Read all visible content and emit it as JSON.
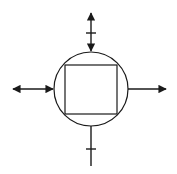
{
  "diagram": {
    "type": "control-block-diagram",
    "stroke_color": "#1a1a1a",
    "background_color": "#ffffff",
    "circle": {
      "cx": 91,
      "cy": 89,
      "r": 37
    },
    "square": {
      "x": 65,
      "y": 65,
      "width": 52,
      "height": 49
    },
    "connectors": [
      {
        "id": "top",
        "orientation": "vertical",
        "from": [
          91,
          12
        ],
        "to": [
          91,
          52
        ],
        "arrow_start": true,
        "arrow_end": true,
        "tick_at": 33
      },
      {
        "id": "left",
        "orientation": "horizontal",
        "from": [
          12,
          89
        ],
        "to": [
          53,
          89
        ],
        "arrow_start": true,
        "arrow_end": true,
        "tick_at": null
      },
      {
        "id": "right",
        "orientation": "horizontal",
        "from": [
          128,
          89
        ],
        "to": [
          167,
          89
        ],
        "arrow_start": false,
        "arrow_end": true,
        "tick_at": null
      },
      {
        "id": "bottom",
        "orientation": "vertical",
        "from": [
          91,
          126
        ],
        "to": [
          91,
          166
        ],
        "arrow_start": false,
        "arrow_end": false,
        "tick_at": 149
      }
    ]
  }
}
